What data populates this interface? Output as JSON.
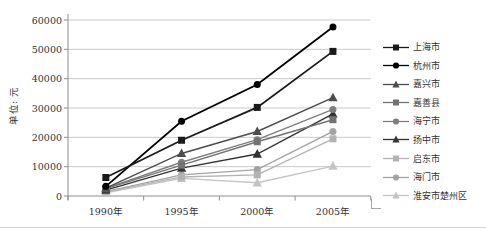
{
  "chart_data": {
    "type": "line",
    "title": "",
    "ylabel": "单位: 元",
    "xlabel": "",
    "categories": [
      "1990年",
      "1995年",
      "2000年",
      "2005年"
    ],
    "ylim": [
      0,
      60000
    ],
    "yticks": [
      0,
      10000,
      20000,
      30000,
      40000,
      50000,
      60000
    ],
    "grid": true,
    "legend_position": "right",
    "series": [
      {
        "name": "上海市",
        "marker": "square",
        "color": "#1a1a1a",
        "values": [
          6300,
          19000,
          30200,
          49300
        ]
      },
      {
        "name": "杭州市",
        "marker": "circle",
        "color": "#000000",
        "values": [
          3300,
          25500,
          38000,
          57600
        ]
      },
      {
        "name": "嘉兴市",
        "marker": "triangle",
        "color": "#4d4d4d",
        "values": [
          2700,
          14500,
          22000,
          33500
        ]
      },
      {
        "name": "嘉善县",
        "marker": "square",
        "color": "#737373",
        "values": [
          2500,
          10500,
          18500,
          26000
        ]
      },
      {
        "name": "海宁市",
        "marker": "circle",
        "color": "#7f7f7f",
        "values": [
          2600,
          11500,
          19200,
          29500
        ]
      },
      {
        "name": "扬中市",
        "marker": "triangle",
        "color": "#333333",
        "values": [
          2000,
          9500,
          14300,
          28000
        ]
      },
      {
        "name": "启东市",
        "marker": "square",
        "color": "#b3b3b3",
        "values": [
          1400,
          6500,
          7200,
          19500
        ]
      },
      {
        "name": "海门市",
        "marker": "circle",
        "color": "#a3a3a3",
        "values": [
          1500,
          7200,
          9000,
          22000
        ]
      },
      {
        "name": "淮安市楚州区",
        "marker": "triangle",
        "color": "#c4c4c4",
        "values": [
          1100,
          6000,
          4500,
          10200
        ]
      }
    ],
    "axis_color": "#8c8c8c",
    "gridline_color": "#c9c9c9",
    "tick_label_color": "#333333"
  }
}
